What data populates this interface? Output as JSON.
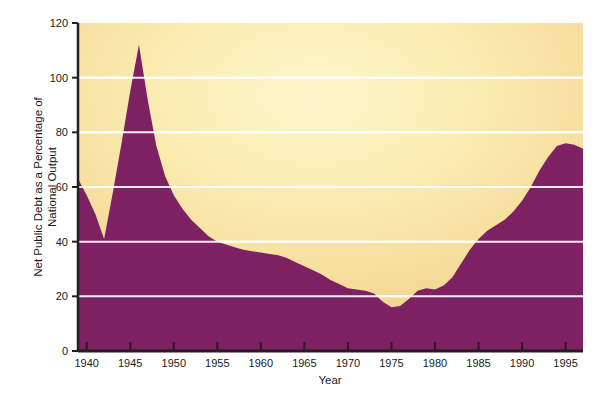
{
  "chart_data": {
    "type": "area",
    "title": "",
    "xlabel": "Year",
    "ylabel": "Net Public Debt as a Percentage of National Output",
    "ylabel_line1": "Net Public Debt as a Percentage of",
    "ylabel_line2": "National Output",
    "xlim": [
      1939,
      1997
    ],
    "ylim": [
      0,
      120
    ],
    "grid": true,
    "gridlines_y": [
      20,
      40,
      60,
      80,
      100
    ],
    "legend": "none",
    "series_name": "Net Public Debt as a Percentage of National Output",
    "fill_color": "#7d2163",
    "background_colors": {
      "center": "#fdf4c4",
      "edge": "#f2cd8e",
      "outer": "#eec27c"
    },
    "gridline_color": "#ffffff",
    "axis_color": "#231f20",
    "ytick_values": [
      0,
      20,
      40,
      60,
      80,
      100,
      120
    ],
    "ytick_labels": [
      "0",
      "20",
      "40",
      "60",
      "80",
      "100",
      "120"
    ],
    "xtick_values": [
      1940,
      1945,
      1950,
      1955,
      1960,
      1965,
      1970,
      1975,
      1980,
      1985,
      1990,
      1995
    ],
    "xtick_labels": [
      "1940",
      "1945",
      "1950",
      "1955",
      "1960",
      "1965",
      "1970",
      "1975",
      "1980",
      "1985",
      "1990",
      "1995"
    ],
    "x": [
      1939,
      1940,
      1941,
      1942,
      1943,
      1944,
      1945,
      1946,
      1947,
      1948,
      1949,
      1950,
      1951,
      1952,
      1953,
      1954,
      1955,
      1956,
      1957,
      1958,
      1959,
      1960,
      1961,
      1962,
      1963,
      1964,
      1965,
      1966,
      1967,
      1968,
      1969,
      1970,
      1971,
      1972,
      1973,
      1974,
      1975,
      1976,
      1977,
      1978,
      1979,
      1980,
      1981,
      1982,
      1983,
      1984,
      1985,
      1986,
      1987,
      1988,
      1989,
      1990,
      1991,
      1992,
      1993,
      1994,
      1995,
      1996,
      1997
    ],
    "values": [
      63,
      57,
      50,
      41,
      58,
      76,
      95,
      112,
      92,
      75,
      64,
      57,
      52,
      48,
      45,
      42,
      40,
      39,
      38,
      37,
      36.5,
      36,
      35.5,
      35,
      34,
      32.5,
      31,
      29.5,
      28,
      26,
      24.5,
      23,
      22.5,
      22,
      21,
      18,
      16,
      16.5,
      19,
      22,
      23,
      22.5,
      24,
      27,
      32,
      37,
      41,
      44,
      46,
      48,
      51,
      55,
      60,
      66,
      71,
      75,
      76,
      75.5,
      74
    ]
  },
  "axis": {
    "x_title": "Year",
    "y_title_line1": "Net Public Debt as a Percentage of",
    "y_title_line2": "National Output"
  }
}
